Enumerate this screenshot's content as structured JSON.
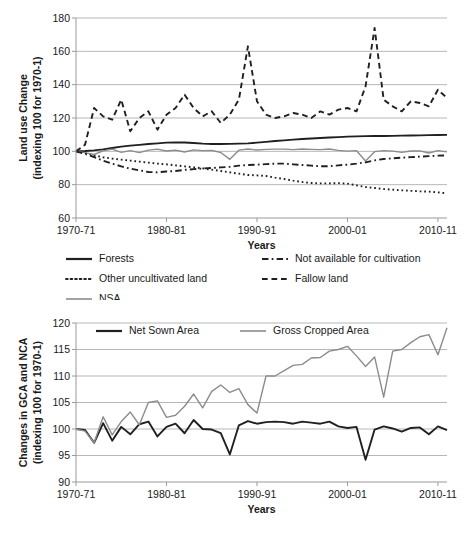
{
  "figure": {
    "charts": [
      {
        "id": "land-use-change",
        "chart_data": {
          "type": "line",
          "title": "",
          "xlabel": "Years",
          "ylabel": "Land use Change\n(indexing 100 for 1970-1)",
          "ylabel_line1": "Land use Change",
          "ylabel_line2": "(indexing 100 for 1970-1)",
          "ylim": [
            60,
            180
          ],
          "yticks": [
            60,
            80,
            100,
            120,
            140,
            160,
            180
          ],
          "xlim": [
            1970,
            2011
          ],
          "xticks": [
            1970,
            1980,
            1990,
            2000,
            2010
          ],
          "xticklabels": [
            "1970-71",
            "1980-81",
            "1990-91",
            "2000-01",
            "2010-11"
          ],
          "grid": true,
          "legend_position": "below",
          "x": [
            1970,
            1971,
            1972,
            1973,
            1974,
            1975,
            1976,
            1977,
            1978,
            1979,
            1980,
            1981,
            1982,
            1983,
            1984,
            1985,
            1986,
            1987,
            1988,
            1989,
            1990,
            1991,
            1992,
            1993,
            1994,
            1995,
            1996,
            1997,
            1998,
            1999,
            2000,
            2001,
            2002,
            2003,
            2004,
            2005,
            2006,
            2007,
            2008,
            2009,
            2010,
            2011
          ],
          "series": [
            {
              "name": "Forests",
              "style": "solid",
              "color": "#231f20",
              "width": 1.9,
              "values": [
                100,
                100.2,
                100.6,
                101.2,
                102.0,
                102.8,
                103.4,
                103.9,
                104.4,
                104.8,
                105.2,
                105.4,
                105.3,
                105.0,
                104.6,
                104.4,
                104.4,
                104.5,
                104.6,
                104.8,
                105.2,
                105.7,
                106.2,
                106.6,
                107.0,
                107.4,
                107.7,
                108.0,
                108.3,
                108.5,
                108.8,
                109.0,
                109.1,
                109.2,
                109.2,
                109.3,
                109.4,
                109.5,
                109.6,
                109.7,
                109.8,
                109.9
              ]
            },
            {
              "name": "Other uncultivated land",
              "style": "dotted",
              "color": "#231f20",
              "width": 1.9,
              "values": [
                100,
                99.0,
                97.6,
                96.4,
                95.6,
                95.0,
                94.4,
                93.8,
                93.2,
                92.6,
                92.2,
                91.6,
                91.0,
                90.4,
                89.8,
                89.0,
                88.2,
                87.4,
                86.6,
                85.8,
                85.6,
                85.2,
                84.2,
                83.4,
                82.4,
                81.6,
                81.0,
                80.8,
                80.8,
                80.9,
                80.6,
                79.6,
                78.6,
                78.0,
                77.4,
                77.0,
                76.6,
                76.3,
                76.0,
                75.8,
                75.4,
                74.8
              ]
            },
            {
              "name": "NSA",
              "style": "solid",
              "color": "#8c8c8c",
              "width": 1.4,
              "values": [
                100,
                99.2,
                98.1,
                100.3,
                101.3,
                99.4,
                100.4,
                99.2,
                100.7,
                101.3,
                100.2,
                100.7,
                99.6,
                100.9,
                100.4,
                100.6,
                99.3,
                95.2,
                100.7,
                101.4,
                100.8,
                101.2,
                101.3,
                101.3,
                101.0,
                101.4,
                101.2,
                101.0,
                101.4,
                100.6,
                100.1,
                100.4,
                94.2,
                99.8,
                100.4,
                100.1,
                99.4,
                100.2,
                100.3,
                99.0,
                100.4,
                99.7
              ]
            },
            {
              "name": "Not available for cultivation",
              "style": "dashdot",
              "color": "#231f20",
              "width": 1.9,
              "values": [
                100,
                98.5,
                96.6,
                94.4,
                92.6,
                91.0,
                89.6,
                88.6,
                87.6,
                87.4,
                87.9,
                88.2,
                88.9,
                89.3,
                89.7,
                90.0,
                90.4,
                90.7,
                91.4,
                91.8,
                92.0,
                92.3,
                92.6,
                92.6,
                92.2,
                91.8,
                91.4,
                91.0,
                91.1,
                91.6,
                92.0,
                92.6,
                93.4,
                94.6,
                95.4,
                95.8,
                96.2,
                96.5,
                96.8,
                97.1,
                97.4,
                97.6
              ]
            },
            {
              "name": "Fallow land",
              "style": "dashed",
              "color": "#231f20",
              "width": 1.9,
              "values": [
                100,
                104,
                126,
                121,
                119,
                131,
                112,
                120,
                124,
                113,
                122,
                126,
                134,
                126,
                121,
                124,
                117,
                122,
                131,
                163,
                130,
                122,
                120,
                121,
                123,
                122,
                120,
                124,
                122,
                125,
                126,
                124,
                139,
                174,
                131,
                127,
                124,
                130,
                129,
                127,
                137,
                132
              ]
            }
          ]
        },
        "legend": [
          {
            "label": "Forests",
            "style": "solid",
            "color": "#231f20",
            "col": 0
          },
          {
            "label": "Not available for cultivation",
            "style": "dashdot",
            "color": "#231f20",
            "col": 1
          },
          {
            "label": "Other uncultivated land",
            "style": "dotted",
            "color": "#231f20",
            "col": 0
          },
          {
            "label": "Fallow land",
            "style": "dashed",
            "color": "#231f20",
            "col": 1
          },
          {
            "label": "NSA",
            "style": "solid",
            "color": "#8c8c8c",
            "col": 0
          }
        ]
      },
      {
        "id": "gca-nca-change",
        "chart_data": {
          "type": "line",
          "title": "",
          "xlabel": "Years",
          "ylabel": "Changes in GCA and NCA\n(indexing 100 for 1970-1)",
          "ylabel_line1": "Changes in GCA and NCA",
          "ylabel_line2": "(indexing 100 for 1970-1)",
          "ylim": [
            90,
            120
          ],
          "yticks": [
            90,
            95,
            100,
            105,
            110,
            115,
            120
          ],
          "xlim": [
            1970,
            2011
          ],
          "xticks": [
            1970,
            1980,
            1990,
            2000,
            2010
          ],
          "xticklabels": [
            "1970-71",
            "1980-81",
            "1990-91",
            "2000-01",
            "2010-11"
          ],
          "grid": true,
          "legend_position": "inside-top",
          "x": [
            1970,
            1971,
            1972,
            1973,
            1974,
            1975,
            1976,
            1977,
            1978,
            1979,
            1980,
            1981,
            1982,
            1983,
            1984,
            1985,
            1986,
            1987,
            1988,
            1989,
            1990,
            1991,
            1992,
            1993,
            1994,
            1995,
            1996,
            1997,
            1998,
            1999,
            2000,
            2001,
            2002,
            2003,
            2004,
            2005,
            2006,
            2007,
            2008,
            2009,
            2010,
            2011
          ],
          "series": [
            {
              "name": "Net Sown Area",
              "style": "solid",
              "color": "#231f20",
              "width": 1.9,
              "values": [
                100,
                99.8,
                97.4,
                101.1,
                97.8,
                100.4,
                99.0,
                100.9,
                101.4,
                98.6,
                100.4,
                101.0,
                99.2,
                101.7,
                100.0,
                99.9,
                99.2,
                95.2,
                100.7,
                101.5,
                101.0,
                101.3,
                101.4,
                101.3,
                101.0,
                101.4,
                101.2,
                101.0,
                101.4,
                100.5,
                100.2,
                100.4,
                94.2,
                99.9,
                100.5,
                100.1,
                99.5,
                100.2,
                100.3,
                99.0,
                100.5,
                99.8
              ]
            },
            {
              "name": "Gross Cropped Area",
              "style": "solid",
              "color": "#8c8c8c",
              "width": 1.4,
              "values": [
                100,
                99.6,
                97.4,
                102.3,
                98.9,
                101.4,
                103.2,
                100.8,
                105.0,
                105.3,
                102.2,
                102.6,
                104.3,
                106.6,
                104.0,
                107.1,
                108.3,
                106.9,
                107.6,
                104.6,
                103.0,
                110.0,
                110.0,
                111.0,
                112.0,
                112.2,
                113.4,
                113.5,
                114.7,
                115.0,
                115.6,
                113.8,
                111.8,
                113.6,
                106.0,
                114.7,
                115.0,
                116.3,
                117.4,
                117.8,
                114.0,
                119.1
              ]
            }
          ]
        },
        "legend": [
          {
            "label": "Net Sown Area",
            "style": "solid",
            "color": "#231f20"
          },
          {
            "label": "Gross Cropped Area",
            "style": "solid",
            "color": "#8c8c8c"
          }
        ]
      }
    ]
  }
}
